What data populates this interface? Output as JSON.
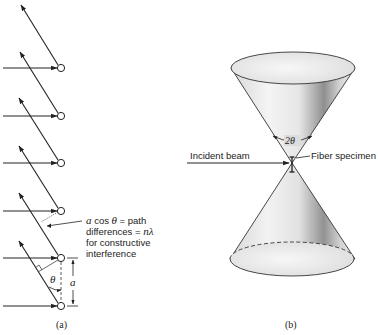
{
  "panel_a": {
    "caption": "(a)",
    "annotation_lines": [
      "a cos θ = path",
      "differences = nλ",
      "for constructive",
      "interference"
    ],
    "annotation": {
      "line1_a": "a",
      "line1_rest": " cos ",
      "line1_theta": "θ",
      "line1_end": " = path",
      "line2_start": "differences = ",
      "line2_n": "n",
      "line2_lambda": "λ",
      "line3": "for constructive",
      "line4": "interference"
    },
    "theta_label": "θ",
    "spacing_label": "a",
    "lattice_points": 6
  },
  "panel_b": {
    "caption": "(b)",
    "incident_beam_label": "Incident beam",
    "fiber_specimen_label": "Fiber specimen",
    "angle_label": "2θ"
  },
  "colors": {
    "line": "#222222",
    "cone_light": "#f2f2f2",
    "cone_mid": "#cfcfcf",
    "cone_dark": "#8a8a8a"
  }
}
